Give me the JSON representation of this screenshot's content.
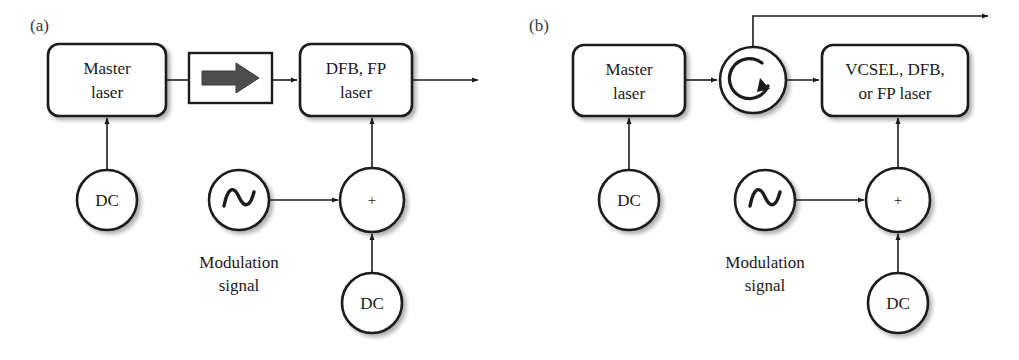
{
  "figure": {
    "background": "#ffffff",
    "stroke_color": "#1c1c1c",
    "arrow_fill": "#4a4a4a",
    "panels": [
      {
        "id": "a",
        "label": "(a)",
        "blocks": [
          {
            "name": "master-laser",
            "line1": "Master",
            "line2": "laser"
          },
          {
            "name": "isolator",
            "line1": "",
            "line2": ""
          },
          {
            "name": "slave-laser",
            "line1": "DFB, FP",
            "line2": "laser"
          }
        ],
        "sources": [
          {
            "name": "dc-bias-master",
            "label": "DC"
          },
          {
            "name": "modulation-source",
            "label": ""
          },
          {
            "name": "summing-node",
            "label": "+"
          },
          {
            "name": "dc-bias-slave",
            "label": "DC"
          }
        ],
        "caption": {
          "line1": "Modulation",
          "line2": "signal"
        }
      },
      {
        "id": "b",
        "label": "(b)",
        "blocks": [
          {
            "name": "master-laser",
            "line1": "Master",
            "line2": "laser"
          },
          {
            "name": "circulator",
            "line1": "",
            "line2": ""
          },
          {
            "name": "slave-laser",
            "line1": "VCSEL, DFB,",
            "line2": "or FP laser"
          }
        ],
        "sources": [
          {
            "name": "dc-bias-master",
            "label": "DC"
          },
          {
            "name": "modulation-source",
            "label": ""
          },
          {
            "name": "summing-node",
            "label": "+"
          },
          {
            "name": "dc-bias-slave",
            "label": "DC"
          }
        ],
        "caption": {
          "line1": "Modulation",
          "line2": "signal"
        }
      }
    ]
  }
}
